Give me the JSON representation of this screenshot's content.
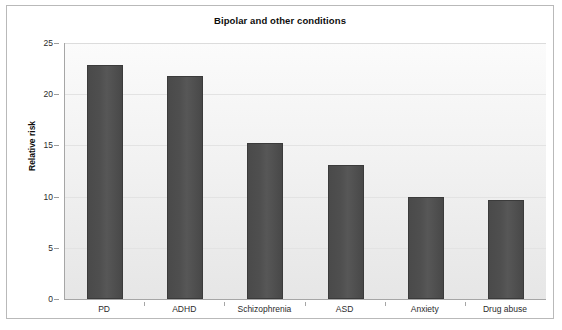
{
  "chart_data": {
    "type": "bar",
    "title": "Bipolar and other conditions",
    "xlabel": "",
    "ylabel": "Relative risk",
    "categories": [
      "PD",
      "ADHD",
      "Schizophrenia",
      "ASD",
      "Anxiety",
      "Drug abuse"
    ],
    "values": [
      22.9,
      21.8,
      15.2,
      13.1,
      10.0,
      9.7
    ],
    "ylim": [
      0,
      25
    ],
    "yticks": [
      0,
      5,
      10,
      15,
      20,
      25
    ],
    "ytick_labels": [
      "0",
      "5",
      "10",
      "15",
      "20",
      "25"
    ],
    "grid": true,
    "legend": false,
    "bar_color": "#4d4d4d",
    "plot_background": "#f2f2f2",
    "frame_color": "#b9b9b9"
  }
}
